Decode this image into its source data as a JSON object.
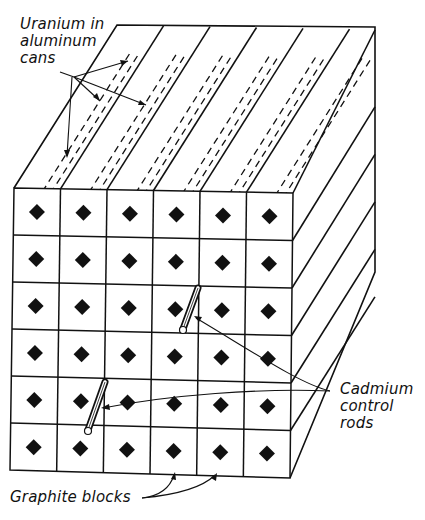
{
  "diagram": {
    "grid": {
      "rows": 6,
      "cols": 6
    },
    "colors": {
      "ink": "#111111",
      "background": "#ffffff"
    },
    "labels": {
      "uranium": [
        "Uranium in",
        "aluminum",
        "cans"
      ],
      "cadmium": [
        "Cadmium",
        "control",
        "rods"
      ],
      "graphite": "Graphite blocks"
    },
    "control_rods": [
      {
        "row": 3,
        "col": 4,
        "description": "inserted rod upper"
      },
      {
        "row": 5,
        "col": 2,
        "description": "inserted rod lower"
      }
    ]
  }
}
